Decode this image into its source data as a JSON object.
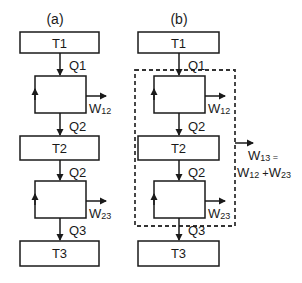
{
  "panels": {
    "a": {
      "label": "(a)",
      "reservoirs": [
        "T1",
        "T2",
        "T3"
      ],
      "heat_flows": [
        "Q1",
        "Q2",
        "Q2",
        "Q3"
      ],
      "work": [
        {
          "base": "W",
          "sub": "12"
        },
        {
          "base": "W",
          "sub": "23"
        }
      ]
    },
    "b": {
      "label": "(b)",
      "reservoirs": [
        "T1",
        "T2",
        "T3"
      ],
      "heat_flows": [
        "Q1",
        "Q2",
        "Q2",
        "Q3"
      ],
      "work": [
        {
          "base": "W",
          "sub": "12"
        },
        {
          "base": "W",
          "sub": "23"
        }
      ],
      "combined_work": {
        "line1_base": "W",
        "line1_sub": "13",
        "line1_suffix": " =",
        "line2_a_base": "W",
        "line2_a_sub": "12",
        "line2_plus": " +",
        "line2_b_base": "W",
        "line2_b_sub": "23"
      }
    }
  },
  "colors": {
    "stroke": "#1a1a1a",
    "background": "#ffffff",
    "dashed": "#333333"
  }
}
